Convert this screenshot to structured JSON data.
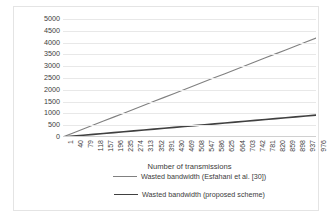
{
  "chart_data": {
    "type": "line",
    "title": "",
    "xlabel": "Number of transmissions",
    "ylabel": "Wasted bandwidth in symbols",
    "x": [
      1,
      40,
      79,
      118,
      157,
      196,
      235,
      274,
      313,
      352,
      391,
      430,
      469,
      508,
      547,
      586,
      625,
      664,
      703,
      742,
      781,
      820,
      859,
      898,
      937,
      976
    ],
    "categories": [
      "1",
      "40",
      "79",
      "118",
      "157",
      "196",
      "235",
      "274",
      "313",
      "352",
      "391",
      "430",
      "469",
      "508",
      "547",
      "586",
      "625",
      "664",
      "703",
      "742",
      "781",
      "820",
      "859",
      "898",
      "937",
      "976"
    ],
    "xlim": [
      1,
      1000
    ],
    "ylim": [
      0,
      5000
    ],
    "ytick_labels": [
      "5000",
      "4500",
      "4000",
      "3500",
      "3000",
      "2500",
      "2000",
      "1500",
      "1000",
      "500",
      "0"
    ],
    "ytick_values": [
      5000,
      4500,
      4000,
      3500,
      3000,
      2500,
      2000,
      1500,
      1000,
      500,
      0
    ],
    "grid": "horizontal",
    "legend_position": "bottom",
    "series": [
      {
        "name": "Wasted bandwidth (Esfahani et al. [30])",
        "color": "#808080",
        "values": [
          4,
          172,
          339,
          507,
          674,
          842,
          1009,
          1177,
          1344,
          1512,
          1679,
          1847,
          2014,
          2182,
          2349,
          2517,
          2684,
          2852,
          3019,
          3187,
          3354,
          3522,
          3689,
          3857,
          4024,
          4192
        ]
      },
      {
        "name": "Wasted bandwidth (proposed scheme)",
        "color": "#404040",
        "values": [
          1,
          38,
          75,
          112,
          149,
          186,
          223,
          260,
          297,
          334,
          371,
          408,
          445,
          482,
          519,
          556,
          593,
          630,
          667,
          704,
          741,
          778,
          815,
          852,
          889,
          926
        ]
      }
    ]
  },
  "legend": {
    "items": [
      {
        "label": "Wasted bandwidth (Esfahani et al. [30])",
        "color": "#808080",
        "width": 1.1
      },
      {
        "label": "Wasted bandwidth (proposed scheme)",
        "color": "#404040",
        "width": 1.8
      }
    ]
  },
  "colors": {
    "gridline": "#e8e8e8",
    "axis": "#d0d0d0",
    "text": "#3b3b3b",
    "frame": "#e4e4e4",
    "background": "#ffffff"
  }
}
